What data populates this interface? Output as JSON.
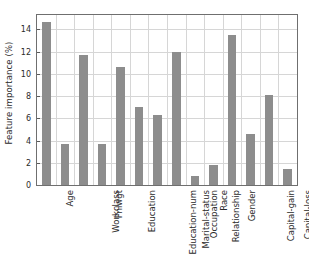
{
  "chart_data": {
    "type": "bar",
    "title": "",
    "xlabel": "",
    "ylabel": "Feature importance (%)",
    "categories": [
      "Age",
      "Workclass",
      "Fnlwgt",
      "Education",
      "Education-num",
      "Marital-status",
      "Occupation",
      "Relationship",
      "Race",
      "Gender",
      "Capital-gain",
      "Capital-loss",
      "Hours-per-week",
      "Native-country"
    ],
    "values": [
      14.7,
      3.7,
      11.7,
      3.7,
      10.6,
      7.0,
      6.3,
      12.0,
      0.8,
      1.8,
      13.5,
      4.6,
      8.1,
      1.4
    ],
    "ylim": [
      0,
      15.3
    ],
    "yticks": [
      0,
      2,
      4,
      6,
      8,
      10,
      12,
      14
    ],
    "ytick_labels": [
      "0",
      "2",
      "4",
      "6",
      "8",
      "10",
      "12",
      "14"
    ],
    "grid": true,
    "legend": null,
    "bar_color": "#8d8d8d",
    "grid_color": "#d6d6d6",
    "axis_color": "#6f6f6f"
  }
}
